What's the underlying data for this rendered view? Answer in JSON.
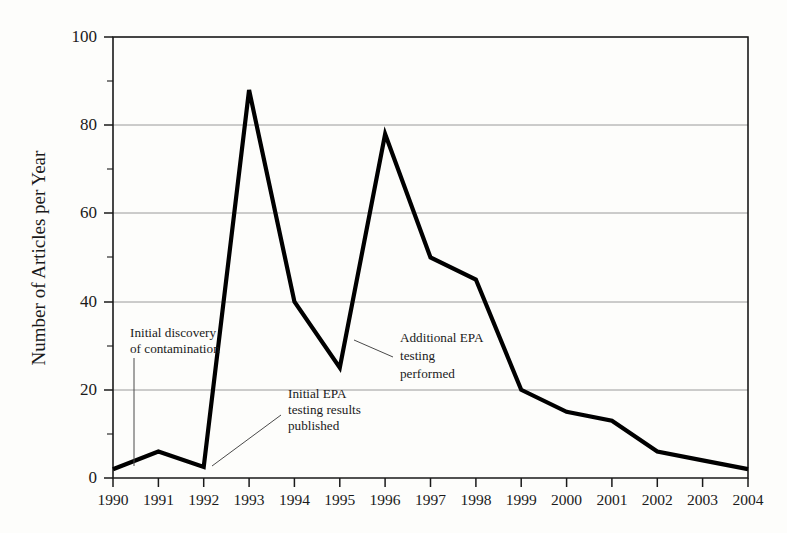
{
  "chart_data": {
    "type": "line",
    "title": "",
    "xlabel": "",
    "ylabel": "Number of Articles per Year",
    "x": [
      1990,
      1991,
      1992,
      1993,
      1994,
      1995,
      1996,
      1997,
      1998,
      1999,
      2000,
      2001,
      2002,
      2003,
      2004
    ],
    "categories": [
      "1990",
      "1991",
      "1992",
      "1993",
      "1994",
      "1995",
      "1996",
      "1997",
      "1998",
      "1999",
      "2000",
      "2001",
      "2002",
      "2003",
      "2004"
    ],
    "values": [
      2,
      6,
      2.5,
      88,
      40,
      25,
      78,
      50,
      45,
      20,
      15,
      13,
      6,
      4,
      2
    ],
    "series": [
      {
        "name": "Number of Articles per Year",
        "values": [
          2,
          6,
          2.5,
          88,
          40,
          25,
          78,
          50,
          45,
          20,
          15,
          13,
          6,
          4,
          2
        ]
      }
    ],
    "ylim": [
      0,
      100
    ],
    "xlim": [
      1990,
      2004
    ],
    "ytick_labels": [
      "0",
      "20",
      "40",
      "60",
      "80",
      "100"
    ],
    "ytick_values": [
      0,
      20,
      40,
      60,
      80,
      100
    ],
    "yminor_tick_values": [
      10,
      30,
      50,
      70,
      90
    ],
    "grid": "horizontal-major",
    "legend": "none",
    "line_color": "#000000",
    "grid_color": "#9a9a9a",
    "axis_color": "#1a1a1a",
    "background_color": "#fdfdfb",
    "annotations": [
      {
        "id": "annotation-initial-discovery",
        "lines": [
          "Initial discovery",
          "of contamination"
        ],
        "points_to_year": 1990,
        "points_to_value": 2
      },
      {
        "id": "annotation-initial-epa-testing",
        "lines": [
          "Initial EPA",
          "testing results",
          "published"
        ],
        "points_to_year": 1992,
        "points_to_value": 2.5
      },
      {
        "id": "annotation-additional-epa-testing",
        "lines": [
          "Additional EPA",
          "testing",
          "performed"
        ],
        "points_to_year": 1995,
        "points_to_value": 25
      }
    ]
  }
}
